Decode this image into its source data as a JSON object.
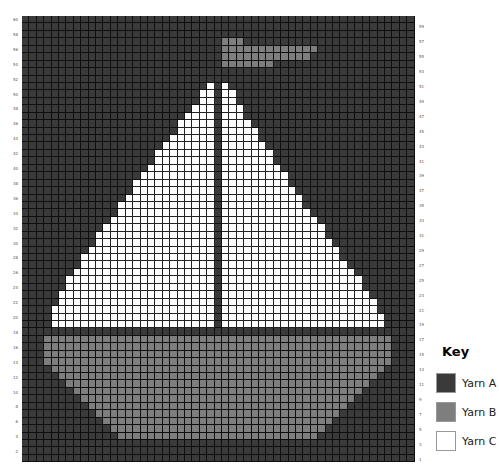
{
  "chart": {
    "columns": 53,
    "rows": 60,
    "row_labels_left": [
      60,
      58,
      56,
      54,
      52,
      50,
      48,
      46,
      44,
      42,
      40,
      38,
      36,
      34,
      32,
      30,
      28,
      26,
      24,
      22,
      20,
      18,
      16,
      14,
      12,
      10,
      8,
      6,
      4,
      2
    ],
    "row_labels_right": [
      59,
      57,
      55,
      53,
      51,
      49,
      47,
      45,
      43,
      41,
      39,
      37,
      35,
      33,
      31,
      29,
      27,
      25,
      23,
      21,
      19,
      17,
      15,
      13,
      11,
      9,
      7,
      5,
      3,
      1
    ],
    "background_yarn": "A",
    "runs_by_row": {
      "57": [
        [
          "B",
          27,
          29
        ]
      ],
      "56": [
        [
          "B",
          27,
          39
        ]
      ],
      "55": [
        [
          "B",
          27,
          38
        ]
      ],
      "54": [
        [
          "B",
          27,
          33
        ]
      ],
      "53": [
        [
          "A",
          26,
          26
        ]
      ],
      "52": [
        [
          "A",
          26,
          26
        ]
      ],
      "51": [
        [
          "C",
          25,
          25
        ],
        [
          "C",
          27,
          27
        ]
      ],
      "50": [
        [
          "C",
          24,
          25
        ],
        [
          "C",
          27,
          28
        ]
      ],
      "49": [
        [
          "C",
          24,
          25
        ],
        [
          "C",
          27,
          28
        ]
      ],
      "48": [
        [
          "C",
          23,
          25
        ],
        [
          "C",
          27,
          29
        ]
      ],
      "47": [
        [
          "C",
          22,
          25
        ],
        [
          "C",
          27,
          29
        ]
      ],
      "46": [
        [
          "C",
          21,
          25
        ],
        [
          "C",
          27,
          30
        ]
      ],
      "45": [
        [
          "C",
          21,
          25
        ],
        [
          "C",
          27,
          31
        ]
      ],
      "44": [
        [
          "C",
          20,
          25
        ],
        [
          "C",
          27,
          31
        ]
      ],
      "43": [
        [
          "C",
          19,
          25
        ],
        [
          "C",
          27,
          32
        ]
      ],
      "42": [
        [
          "C",
          18,
          25
        ],
        [
          "C",
          27,
          33
        ]
      ],
      "41": [
        [
          "C",
          18,
          25
        ],
        [
          "C",
          27,
          33
        ]
      ],
      "40": [
        [
          "C",
          17,
          25
        ],
        [
          "C",
          27,
          34
        ]
      ],
      "39": [
        [
          "C",
          16,
          25
        ],
        [
          "C",
          27,
          35
        ]
      ],
      "38": [
        [
          "C",
          15,
          25
        ],
        [
          "C",
          27,
          35
        ]
      ],
      "37": [
        [
          "C",
          15,
          25
        ],
        [
          "C",
          27,
          36
        ]
      ],
      "36": [
        [
          "C",
          14,
          25
        ],
        [
          "C",
          27,
          37
        ]
      ],
      "35": [
        [
          "C",
          13,
          25
        ],
        [
          "C",
          27,
          37
        ]
      ],
      "34": [
        [
          "C",
          13,
          25
        ],
        [
          "C",
          27,
          38
        ]
      ],
      "33": [
        [
          "C",
          12,
          25
        ],
        [
          "C",
          27,
          39
        ]
      ],
      "32": [
        [
          "C",
          11,
          25
        ],
        [
          "C",
          27,
          40
        ]
      ],
      "31": [
        [
          "C",
          10,
          25
        ],
        [
          "C",
          27,
          40
        ]
      ],
      "30": [
        [
          "C",
          10,
          25
        ],
        [
          "C",
          27,
          41
        ]
      ],
      "29": [
        [
          "C",
          9,
          25
        ],
        [
          "C",
          27,
          42
        ]
      ],
      "28": [
        [
          "C",
          8,
          25
        ],
        [
          "C",
          27,
          42
        ]
      ],
      "27": [
        [
          "C",
          8,
          25
        ],
        [
          "C",
          27,
          43
        ]
      ],
      "26": [
        [
          "C",
          7,
          25
        ],
        [
          "C",
          27,
          44
        ]
      ],
      "25": [
        [
          "C",
          6,
          25
        ],
        [
          "C",
          27,
          45
        ]
      ],
      "24": [
        [
          "C",
          6,
          25
        ],
        [
          "C",
          27,
          45
        ]
      ],
      "23": [
        [
          "C",
          5,
          25
        ],
        [
          "C",
          27,
          46
        ]
      ],
      "22": [
        [
          "C",
          5,
          25
        ],
        [
          "C",
          27,
          47
        ]
      ],
      "21": [
        [
          "C",
          4,
          25
        ],
        [
          "C",
          27,
          47
        ]
      ],
      "20": [
        [
          "C",
          4,
          25
        ],
        [
          "C",
          27,
          48
        ]
      ],
      "19": [
        [
          "C",
          4,
          25
        ],
        [
          "C",
          27,
          48
        ]
      ],
      "18": [],
      "17": [
        [
          "B",
          3,
          49
        ]
      ],
      "16": [
        [
          "B",
          3,
          49
        ]
      ],
      "15": [
        [
          "B",
          3,
          49
        ]
      ],
      "14": [
        [
          "B",
          3,
          49
        ]
      ],
      "13": [
        [
          "B",
          4,
          48
        ]
      ],
      "12": [
        [
          "B",
          5,
          47
        ]
      ],
      "11": [
        [
          "B",
          6,
          46
        ]
      ],
      "10": [
        [
          "B",
          7,
          45
        ]
      ],
      "9": [
        [
          "B",
          8,
          44
        ]
      ],
      "8": [
        [
          "B",
          9,
          43
        ]
      ],
      "7": [
        [
          "B",
          10,
          42
        ]
      ],
      "6": [
        [
          "B",
          11,
          41
        ]
      ],
      "5": [
        [
          "B",
          12,
          40
        ]
      ],
      "4": [
        [
          "B",
          13,
          39
        ]
      ]
    }
  },
  "key": {
    "title": "Key",
    "items": [
      {
        "id": "A",
        "label": "Yarn A",
        "color": "#3a3a3a"
      },
      {
        "id": "B",
        "label": "Yarn B",
        "color": "#7e7e7e"
      },
      {
        "id": "C",
        "label": "Yarn C",
        "color": "#ffffff"
      }
    ]
  }
}
